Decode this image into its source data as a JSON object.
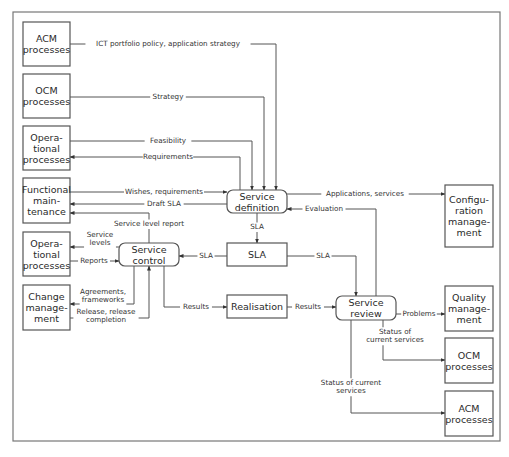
{
  "diagram": {
    "frame": {
      "x": 13,
      "y": 12,
      "w": 487,
      "h": 429
    },
    "nodes": [
      {
        "id": "acm-left",
        "lines": [
          "ACM",
          "processes"
        ],
        "x": 23,
        "y": 22,
        "w": 47,
        "h": 44,
        "rounded": false
      },
      {
        "id": "ocm-left",
        "lines": [
          "OCM",
          "processes"
        ],
        "x": 23,
        "y": 74,
        "w": 47,
        "h": 44,
        "rounded": false
      },
      {
        "id": "operational-top",
        "lines": [
          "Opera-",
          "tional",
          "processes"
        ],
        "x": 23,
        "y": 126,
        "w": 47,
        "h": 44,
        "rounded": false
      },
      {
        "id": "functional-maintenance",
        "lines": [
          "Functional",
          "main-",
          "tenance"
        ],
        "x": 23,
        "y": 178,
        "w": 47,
        "h": 45,
        "rounded": false
      },
      {
        "id": "operational-bottom",
        "lines": [
          "Opera-",
          "tional",
          "processes"
        ],
        "x": 23,
        "y": 232,
        "w": 47,
        "h": 44,
        "rounded": false
      },
      {
        "id": "change-management",
        "lines": [
          "Change",
          "manage-",
          "ment"
        ],
        "x": 23,
        "y": 285,
        "w": 47,
        "h": 45,
        "rounded": false
      },
      {
        "id": "service-definition",
        "lines": [
          "Service",
          "definition"
        ],
        "x": 227,
        "y": 190,
        "w": 60,
        "h": 23,
        "rounded": true
      },
      {
        "id": "sla",
        "lines": [
          "SLA"
        ],
        "x": 227,
        "y": 243,
        "w": 60,
        "h": 23,
        "rounded": false
      },
      {
        "id": "service-control",
        "lines": [
          "Service",
          "control"
        ],
        "x": 119,
        "y": 243,
        "w": 60,
        "h": 23,
        "rounded": true
      },
      {
        "id": "realisation",
        "lines": [
          "Realisation"
        ],
        "x": 227,
        "y": 295,
        "w": 60,
        "h": 23,
        "rounded": false
      },
      {
        "id": "service-review",
        "lines": [
          "Service",
          "review"
        ],
        "x": 336,
        "y": 296,
        "w": 60,
        "h": 24,
        "rounded": true
      },
      {
        "id": "configuration-management",
        "lines": [
          "Configu-",
          "ration",
          "manage-",
          "ment"
        ],
        "x": 445,
        "y": 185,
        "w": 48,
        "h": 62,
        "rounded": false
      },
      {
        "id": "quality-management",
        "lines": [
          "Quality",
          "manage-",
          "ment"
        ],
        "x": 445,
        "y": 286,
        "w": 48,
        "h": 45,
        "rounded": false
      },
      {
        "id": "ocm-right",
        "lines": [
          "OCM",
          "processes"
        ],
        "x": 445,
        "y": 338,
        "w": 48,
        "h": 45,
        "rounded": false
      },
      {
        "id": "acm-right",
        "lines": [
          "ACM",
          "processes"
        ],
        "x": 445,
        "y": 391,
        "w": 48,
        "h": 45,
        "rounded": false
      }
    ],
    "edges": [
      {
        "id": "ict-portfolio-policy",
        "label": [
          "ICT portfolio policy,  application strategy"
        ],
        "points": [
          [
            70,
            44
          ],
          [
            276,
            44
          ],
          [
            276,
            190
          ]
        ],
        "arrow": "end",
        "label_pos": [
          168,
          46
        ]
      },
      {
        "id": "strategy",
        "label": [
          "Strategy"
        ],
        "points": [
          [
            70,
            97
          ],
          [
            264,
            97
          ],
          [
            264,
            190
          ]
        ],
        "arrow": "end",
        "label_pos": [
          168,
          99
        ]
      },
      {
        "id": "feasibility",
        "label": [
          "Feasibility"
        ],
        "points": [
          [
            70,
            141
          ],
          [
            252,
            141
          ],
          [
            252,
            190
          ]
        ],
        "arrow": "end",
        "label_pos": [
          168,
          143
        ]
      },
      {
        "id": "requirements",
        "label": [
          "Requirements"
        ],
        "points": [
          [
            240,
            190
          ],
          [
            240,
            157
          ],
          [
            70,
            157
          ]
        ],
        "arrow": "end",
        "label_pos": [
          168,
          159
        ]
      },
      {
        "id": "wishes-requirements",
        "label": [
          "Wishes, requirements"
        ],
        "points": [
          [
            70,
            192
          ],
          [
            227,
            192
          ]
        ],
        "arrow": "end",
        "label_pos": [
          164,
          194
        ]
      },
      {
        "id": "draft-sla",
        "label": [
          "Draft SLA"
        ],
        "points": [
          [
            227,
            204
          ],
          [
            70,
            204
          ]
        ],
        "arrow": "end",
        "label_pos": [
          164,
          206
        ]
      },
      {
        "id": "service-level-report",
        "label": [
          "Service level report"
        ],
        "points": [
          [
            149,
            243
          ],
          [
            149,
            213
          ],
          [
            70,
            213
          ]
        ],
        "arrow": "end",
        "label_pos": [
          149,
          226
        ]
      },
      {
        "id": "service-levels",
        "label": [
          "Service",
          "levels"
        ],
        "points": [
          [
            119,
            247
          ],
          [
            70,
            247
          ]
        ],
        "arrow": "end",
        "label_pos": [
          100,
          241
        ]
      },
      {
        "id": "reports",
        "label": [
          "Reports"
        ],
        "points": [
          [
            70,
            261
          ],
          [
            119,
            261
          ]
        ],
        "arrow": "end",
        "label_pos": [
          94,
          263
        ]
      },
      {
        "id": "sla-to-control",
        "label": [
          "SLA"
        ],
        "points": [
          [
            227,
            256
          ],
          [
            179,
            256
          ]
        ],
        "arrow": "end",
        "label_pos": [
          206,
          258
        ]
      },
      {
        "id": "definition-to-sla",
        "label": [
          "SLA"
        ],
        "points": [
          [
            257,
            213
          ],
          [
            257,
            243
          ]
        ],
        "arrow": "end",
        "label_pos": [
          257,
          229
        ]
      },
      {
        "id": "agreements-frameworks",
        "label": [
          "Agreements,",
          "frameworks"
        ],
        "points": [
          [
            134,
            266
          ],
          [
            134,
            304
          ],
          [
            70,
            304
          ]
        ],
        "arrow": "end",
        "label_pos": [
          103,
          298
        ]
      },
      {
        "id": "release-completion",
        "label": [
          "Release, release",
          "completion"
        ],
        "points": [
          [
            70,
            318
          ],
          [
            149,
            318
          ],
          [
            149,
            266
          ]
        ],
        "arrow": "end",
        "label_pos": [
          106,
          318
        ]
      },
      {
        "id": "results-to-realisation",
        "label": [
          "Results"
        ],
        "points": [
          [
            164,
            266
          ],
          [
            164,
            307
          ],
          [
            227,
            307
          ]
        ],
        "arrow": "end",
        "label_pos": [
          196,
          309
        ]
      },
      {
        "id": "results-to-review",
        "label": [
          "Results"
        ],
        "points": [
          [
            287,
            307
          ],
          [
            336,
            307
          ]
        ],
        "arrow": "end",
        "label_pos": [
          308,
          309
        ]
      },
      {
        "id": "sla-to-review",
        "label": [
          "SLA"
        ],
        "points": [
          [
            287,
            256
          ],
          [
            356,
            256
          ],
          [
            356,
            296
          ]
        ],
        "arrow": "end",
        "label_pos": [
          323,
          258
        ]
      },
      {
        "id": "evaluation",
        "label": [
          "Evaluation"
        ],
        "points": [
          [
            376,
            296
          ],
          [
            376,
            209
          ],
          [
            287,
            209
          ]
        ],
        "arrow": "end",
        "label_pos": [
          324,
          211
        ]
      },
      {
        "id": "applications-services",
        "label": [
          "Applications, services"
        ],
        "points": [
          [
            287,
            194
          ],
          [
            445,
            194
          ]
        ],
        "arrow": "end",
        "label_pos": [
          365,
          196
        ]
      },
      {
        "id": "problems",
        "label": [
          "Problems"
        ],
        "points": [
          [
            396,
            314
          ],
          [
            445,
            314
          ]
        ],
        "arrow": "end",
        "label_pos": [
          419,
          316
        ]
      },
      {
        "id": "status-to-ocm",
        "label": [
          "Status of",
          "current services"
        ],
        "points": [
          [
            383,
            320
          ],
          [
            383,
            360
          ],
          [
            445,
            360
          ]
        ],
        "arrow": "end",
        "label_pos": [
          395,
          338
        ]
      },
      {
        "id": "status-to-acm",
        "label": [
          "Status of current",
          "services"
        ],
        "points": [
          [
            351,
            320
          ],
          [
            351,
            413
          ],
          [
            445,
            413
          ]
        ],
        "arrow": "end",
        "label_pos": [
          351,
          389
        ]
      }
    ]
  }
}
